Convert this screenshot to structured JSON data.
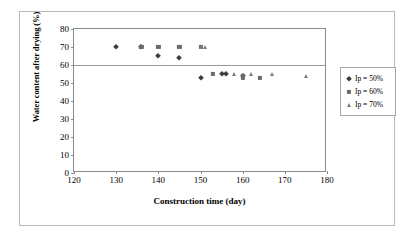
{
  "chart_data": {
    "type": "scatter",
    "title": "",
    "xlabel": "Construction time (day)",
    "ylabel": "Water content after drying (%)",
    "xlim": [
      120,
      180
    ],
    "ylim": [
      0,
      80
    ],
    "xticks": [
      120,
      130,
      140,
      150,
      160,
      170,
      180
    ],
    "yticks": [
      0,
      10,
      20,
      30,
      40,
      50,
      60,
      70,
      80
    ],
    "grid": "horizontal-at-60-only",
    "legend_position": "right",
    "series": [
      {
        "name": "Ip = 50%",
        "marker": "diamond",
        "color": "#3b3b3b",
        "points": [
          {
            "x": 130,
            "y": 70
          },
          {
            "x": 136,
            "y": 70
          },
          {
            "x": 140,
            "y": 65
          },
          {
            "x": 145,
            "y": 64
          },
          {
            "x": 150,
            "y": 53
          },
          {
            "x": 155,
            "y": 55
          },
          {
            "x": 156,
            "y": 55
          },
          {
            "x": 160,
            "y": 54
          }
        ]
      },
      {
        "name": "Ip = 60%",
        "marker": "square",
        "color": "#6a6a6a",
        "points": [
          {
            "x": 136,
            "y": 70
          },
          {
            "x": 140,
            "y": 70
          },
          {
            "x": 145,
            "y": 70
          },
          {
            "x": 150,
            "y": 70
          },
          {
            "x": 153,
            "y": 55
          },
          {
            "x": 160,
            "y": 54
          },
          {
            "x": 160,
            "y": 53
          },
          {
            "x": 164,
            "y": 53
          }
        ]
      },
      {
        "name": "Ip = 70%",
        "marker": "triangle",
        "color": "#7d7d7d",
        "points": [
          {
            "x": 150,
            "y": 70
          },
          {
            "x": 151,
            "y": 70
          },
          {
            "x": 158,
            "y": 55
          },
          {
            "x": 162,
            "y": 55
          },
          {
            "x": 167,
            "y": 55
          },
          {
            "x": 175,
            "y": 54
          }
        ]
      }
    ]
  }
}
